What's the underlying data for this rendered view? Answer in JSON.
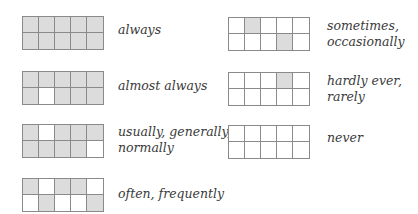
{
  "colors": {
    "filled": "#dcdcdc",
    "empty": "#ffffff",
    "border": "#8a8a8a",
    "text": "#3a3a3a"
  },
  "items": [
    {
      "label": "always",
      "grid": [
        [
          1,
          1,
          1,
          1,
          1
        ],
        [
          1,
          1,
          1,
          1,
          1
        ]
      ]
    },
    {
      "label": "almost always",
      "grid": [
        [
          1,
          1,
          1,
          1,
          1
        ],
        [
          1,
          0,
          1,
          1,
          1
        ]
      ]
    },
    {
      "label": "usually, generally,\nnormally",
      "grid": [
        [
          1,
          0,
          1,
          1,
          1
        ],
        [
          1,
          1,
          1,
          1,
          0
        ]
      ]
    },
    {
      "label": "often, frequently",
      "grid": [
        [
          1,
          0,
          1,
          1,
          0
        ],
        [
          0,
          1,
          0,
          0,
          1
        ]
      ]
    },
    {
      "label": "sometimes,\noccasionally",
      "grid": [
        [
          0,
          1,
          0,
          0,
          0
        ],
        [
          0,
          0,
          0,
          1,
          0
        ]
      ]
    },
    {
      "label": "hardly ever,\nrarely",
      "grid": [
        [
          0,
          0,
          0,
          1,
          0
        ],
        [
          0,
          0,
          0,
          0,
          0
        ]
      ]
    },
    {
      "label": "never",
      "grid": [
        [
          0,
          0,
          0,
          0,
          0
        ],
        [
          0,
          0,
          0,
          0,
          0
        ]
      ]
    }
  ]
}
